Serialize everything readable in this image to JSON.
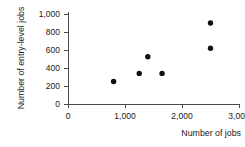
{
  "chart_data": {
    "type": "scatter",
    "title": "",
    "xlabel": "Number of jobs",
    "ylabel": "Number of entry-level jobs",
    "xlim": [
      0,
      3000
    ],
    "ylim": [
      0,
      1000
    ],
    "grid": false,
    "legend": null,
    "xticks": [
      0,
      1000,
      2000,
      3000
    ],
    "xticklabels": [
      "0",
      "1,000",
      "2,000",
      "3,000"
    ],
    "yticks": [
      0,
      200,
      400,
      600,
      800,
      1000
    ],
    "yticklabels": [
      "0",
      "200",
      "400",
      "600",
      "800",
      "1,000"
    ],
    "series": [
      {
        "name": "jobs",
        "marker": "circle",
        "color": "#111111",
        "points": [
          {
            "x": 800,
            "y": 250
          },
          {
            "x": 1250,
            "y": 340
          },
          {
            "x": 1400,
            "y": 525
          },
          {
            "x": 1650,
            "y": 340
          },
          {
            "x": 2500,
            "y": 900
          },
          {
            "x": 2500,
            "y": 620
          }
        ]
      }
    ]
  },
  "axis_style": {
    "line_color": "#4a4a4a",
    "point_color": "#111111"
  }
}
